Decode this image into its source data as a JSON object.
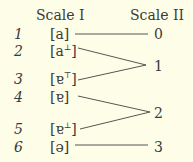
{
  "headers": {
    "left": "Scale I",
    "right": "Scale II"
  },
  "rows": [
    {
      "num": "1",
      "base": "[a",
      "sup": "",
      "close": "]"
    },
    {
      "num": "2",
      "base": "[a",
      "sup": "⊥",
      "close": "]"
    },
    {
      "num": "3",
      "base": "[ɐ",
      "sup": "⊤",
      "close": "]"
    },
    {
      "num": "4",
      "base": "[ɐ",
      "sup": "",
      "close": "]"
    },
    {
      "num": "5",
      "base": "[ɐ",
      "sup": "⊥",
      "close": "]"
    },
    {
      "num": "6",
      "base": "[ə",
      "sup": "",
      "close": "]"
    }
  ],
  "scale2": [
    "0",
    "1",
    "2",
    "3"
  ],
  "mapping": [
    {
      "from": "1",
      "to": "0"
    },
    {
      "from": "2",
      "to": "1"
    },
    {
      "from": "3",
      "to": "1"
    },
    {
      "from": "4",
      "to": "2"
    },
    {
      "from": "5",
      "to": "2"
    },
    {
      "from": "6",
      "to": "3"
    }
  ]
}
